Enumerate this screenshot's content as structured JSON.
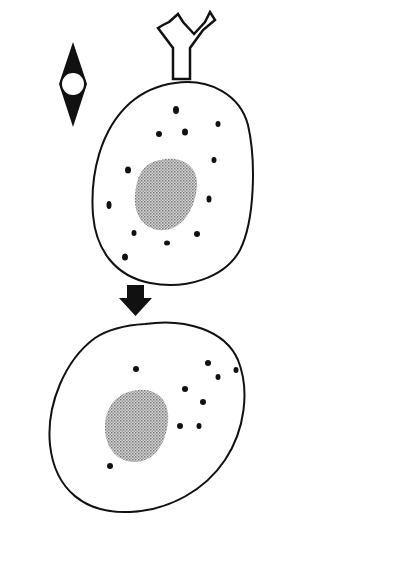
{
  "labels": {
    "allergen": "Allergen",
    "ige_antibody": "IgE antibody",
    "mast_cell": "Mast cell",
    "sensitized_line1": "Sensitized",
    "sensitized_line2": "mast cell",
    "release_line1": "Release of pharma-",
    "release_line2": "cological mediators",
    "bridge_line1": "Allergen bridges",
    "bridge_line2": "two binding sites",
    "bridge_line3": "leading to reaction"
  },
  "colors": {
    "ink": "#111111",
    "nucleus_fill": "#b5b5b5",
    "background": "#ffffff"
  },
  "icons": {
    "allergen": "allergen-diamond-icon",
    "antibody": "ige-y-antibody-icon",
    "down_arrow": "down-arrow-icon",
    "right_arrow": "right-arrow-icon"
  }
}
